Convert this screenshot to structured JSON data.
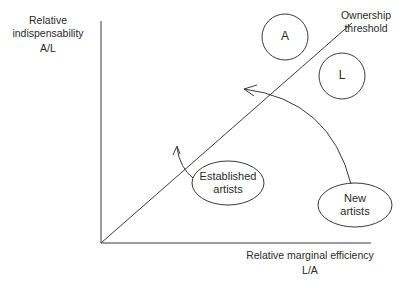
{
  "diagram": {
    "y_axis": {
      "label": "Relative indispensability",
      "label_line1": "Relative",
      "label_line2": "indispensability",
      "unit": "A/L"
    },
    "x_axis": {
      "label": "Relative marginal efficiency",
      "unit": "L/A"
    },
    "threshold_line": {
      "label_line1": "Ownership",
      "label_line2": "threshold"
    },
    "nodes": {
      "a": {
        "label": "A"
      },
      "l": {
        "label": "L"
      },
      "established": {
        "line1": "Established",
        "line2": "artists"
      },
      "new": {
        "line1": "New",
        "line2": "artists"
      }
    },
    "arrows": [
      {
        "from": "Established artists",
        "to": "above ownership threshold"
      },
      {
        "from": "New artists",
        "to": "across ownership threshold"
      }
    ],
    "colors": {
      "line": "#3a3a3a",
      "background": "#ffffff"
    }
  }
}
